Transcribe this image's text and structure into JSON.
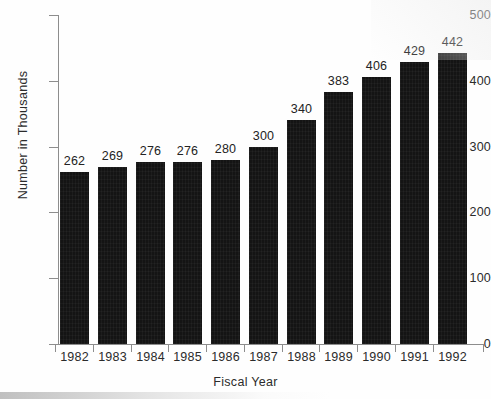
{
  "chart_data": {
    "type": "bar",
    "title": "",
    "subtitle": "",
    "xlabel": "Fiscal Year",
    "ylabel": "Number in Thousands",
    "categories": [
      "1982",
      "1983",
      "1984",
      "1985",
      "1986",
      "1987",
      "1988",
      "1989",
      "1990",
      "1991",
      "1992"
    ],
    "values": [
      262,
      269,
      276,
      276,
      280,
      300,
      340,
      383,
      406,
      429,
      442
    ],
    "data_labels": [
      "262",
      "269",
      "276",
      "276",
      "280",
      "300",
      "340",
      "383",
      "406",
      "429",
      "442"
    ],
    "ylim": [
      0,
      500
    ],
    "y_ticks": [
      0,
      100,
      200,
      300,
      400,
      500
    ],
    "y_tick_labels": [
      "0",
      "100",
      "200",
      "300",
      "400",
      "500"
    ],
    "grid": false,
    "legend": false,
    "legend_position": "none",
    "bar_color": "#141414",
    "axis_color": "#8d8d8d",
    "text_color": "#2b2b2b",
    "background_color": "#ffffff"
  }
}
